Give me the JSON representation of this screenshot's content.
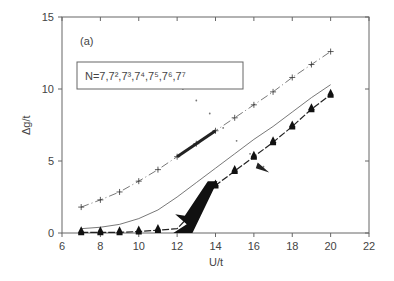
{
  "chart_data": {
    "type": "line",
    "title": "",
    "panel_label": "(a)",
    "xlabel": "U/t",
    "ylabel": "Δg/t",
    "xlim": [
      6,
      22
    ],
    "ylim": [
      0,
      15
    ],
    "xticks": [
      6,
      8,
      10,
      12,
      14,
      16,
      18,
      20,
      22
    ],
    "yticks": [
      0,
      5,
      10,
      15
    ],
    "grid": false,
    "legend": {
      "text": "N=7,7²,7³,7⁴,7⁵,7⁶,7⁷",
      "position": "upper-left"
    },
    "series": [
      {
        "name": "N=7 (plus markers, dash-dot)",
        "marker": "plus",
        "x": [
          7,
          8,
          9,
          10,
          11,
          12,
          13,
          14,
          15,
          16,
          17,
          18,
          19,
          20
        ],
        "y": [
          1.8,
          2.3,
          2.85,
          3.6,
          4.4,
          5.3,
          6.2,
          7.1,
          8.0,
          8.9,
          9.8,
          10.8,
          11.7,
          12.6
        ]
      },
      {
        "name": "solid reference line",
        "marker": "none",
        "x": [
          7,
          8,
          9,
          10,
          11,
          12,
          13,
          14,
          15,
          16,
          17,
          18,
          19,
          20
        ],
        "y": [
          0.3,
          0.4,
          0.6,
          1.0,
          1.6,
          2.5,
          3.5,
          4.5,
          5.5,
          6.5,
          7.4,
          8.4,
          9.4,
          10.3
        ]
      },
      {
        "name": "larger N (filled markers, dashed)",
        "marker": "filled",
        "x": [
          7,
          8,
          9,
          10,
          11,
          12,
          12.5,
          13,
          13.5,
          14,
          15,
          16,
          17,
          18,
          19,
          20
        ],
        "y": [
          0.05,
          0.05,
          0.05,
          0.1,
          0.2,
          0.3,
          1.0,
          1.8,
          2.6,
          3.3,
          4.3,
          5.3,
          6.3,
          7.4,
          8.6,
          9.6
        ]
      },
      {
        "name": "dotted trace",
        "marker": "dot",
        "x": [
          12.3,
          13,
          13.7,
          14.4,
          15.1,
          15.8,
          16.5
        ],
        "y": [
          10.0,
          9.2,
          8.3,
          7.3,
          6.4,
          5.5,
          4.6
        ]
      }
    ]
  }
}
